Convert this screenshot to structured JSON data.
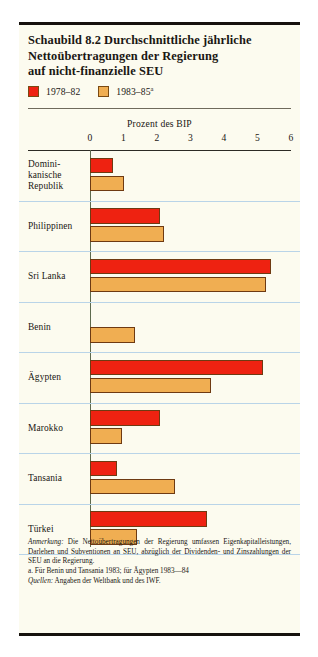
{
  "figure": {
    "title_lines": [
      "Schaubild 8.2   Durchschnittliche jährliche",
      "Nettoübertragungen der Regierung",
      "auf nicht-finanzielle SEU"
    ],
    "legend": [
      {
        "label": "1978–82",
        "sup": "",
        "color": "#ee2211",
        "name": "series-1978-82"
      },
      {
        "label": "1983–85",
        "sup": "a",
        "color": "#f0ae52",
        "name": "series-1983-85"
      }
    ],
    "notes": [
      "Anmerkung: Die Nettoübertragungen der Regierung umfassen Eigenkapitalleistungen, Darlehen und Subventionen an SEU, abzüglich der Dividenden- und Zinszahlungen der SEU an die Regierung.",
      "a. Für Benin und Tansania 1983; für Ägypten 1983—84",
      "Quellen: Angaben der Weltbank und des IWF."
    ],
    "note_italic_leads": [
      "Anmerkung:",
      "",
      "Quellen:"
    ]
  },
  "chart_data": {
    "type": "bar",
    "orientation": "horizontal",
    "title": "Schaubild 8.2   Durchschnittliche jährliche Nettoübertragungen der Regierung auf nicht-finanzielle SEU",
    "xlabel": "Prozent des BIP",
    "ylabel": "",
    "xlim": [
      0,
      6
    ],
    "xticks": [
      0,
      1,
      2,
      3,
      4,
      5,
      6
    ],
    "xticklabels": [
      "0",
      "1",
      "2",
      "3",
      "4",
      "5",
      "6"
    ],
    "grid": false,
    "legend_position": "top-left",
    "categories": [
      "Dominikanische Republik",
      "Philippinen",
      "Sri Lanka",
      "Benin",
      "Ägypten",
      "Marokko",
      "Tansania",
      "Türkei"
    ],
    "category_label_lines": [
      [
        "Domini-",
        "kanische",
        "Republik"
      ],
      [
        "Philippinen"
      ],
      [
        "Sri Lanka"
      ],
      [
        "Benin"
      ],
      [
        "Ägypten"
      ],
      [
        "Marokko"
      ],
      [
        "Tansania"
      ],
      [
        "Türkei"
      ]
    ],
    "series": [
      {
        "name": "1978–82",
        "color": "#ee2211",
        "values": [
          0.7,
          2.1,
          5.4,
          null,
          5.15,
          2.1,
          0.8,
          3.5
        ]
      },
      {
        "name": "1983–85",
        "color": "#f0ae52",
        "values": [
          1.0,
          2.2,
          5.25,
          1.35,
          3.6,
          0.95,
          2.55,
          1.4
        ]
      }
    ]
  }
}
